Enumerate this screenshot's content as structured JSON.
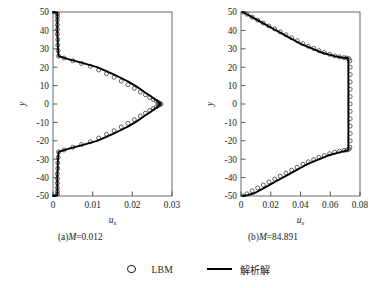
{
  "figure": {
    "background": "#ffffff",
    "ink_color": "#000000",
    "marker_color": "#3c3c3c",
    "axis_color": "#4a4a4a"
  },
  "legend": {
    "position": "bottom-center",
    "entries": [
      {
        "symbol": "open-circle",
        "label": "LBM"
      },
      {
        "symbol": "solid-line",
        "label": "解析解"
      }
    ]
  },
  "captions": {
    "a": {
      "prefix": "(a)",
      "symbol": "M",
      "value": "=0.012",
      "full": "(a)M=0.012"
    },
    "b": {
      "prefix": "(b)",
      "symbol": "M",
      "value": "=84.891",
      "full": "(b)M=84.891"
    }
  },
  "chart_data": [
    {
      "type": "line",
      "panel": "a",
      "title": "(a)M=0.012",
      "xlabel": "u_x",
      "xlabel_base": "u",
      "xlabel_sub": "x",
      "ylabel": "y",
      "xlim": [
        0,
        0.03
      ],
      "ylim": [
        -50,
        50
      ],
      "xticks": [
        0,
        0.01,
        0.02,
        0.03
      ],
      "xticklabels": [
        "0",
        "0.01",
        "0.02",
        "0.03"
      ],
      "yticks": [
        50,
        40,
        30,
        20,
        10,
        0,
        -10,
        -20,
        -30,
        -40,
        -50
      ],
      "yticklabels": [
        "50",
        "40",
        "30",
        "20",
        "10",
        "0",
        "-10",
        "-20",
        "-30",
        "-40",
        "-50"
      ],
      "grid": false,
      "series": [
        {
          "name": "解析解",
          "style": "solid-line",
          "x": [
            0.0,
            0.0011,
            0.0011,
            0.0011,
            0.0011,
            0.0011,
            0.0012,
            0.0012,
            0.0013,
            0.0014,
            0.0036,
            0.0062,
            0.0087,
            0.0111,
            0.0133,
            0.0154,
            0.0173,
            0.0191,
            0.0207,
            0.0221,
            0.0234,
            0.0245,
            0.0254,
            0.0261,
            0.0266,
            0.0269,
            0.027,
            0.0269,
            0.0266,
            0.0261,
            0.0254,
            0.0245,
            0.0234,
            0.0221,
            0.0207,
            0.0191,
            0.0173,
            0.0154,
            0.0133,
            0.0111,
            0.0087,
            0.0062,
            0.0036,
            0.0014,
            0.0013,
            0.0012,
            0.0012,
            0.0011,
            0.0011,
            0.0011,
            0.0011,
            0.0011,
            0.0
          ],
          "y": [
            50,
            49.5,
            48,
            45,
            42,
            38,
            35,
            32,
            29,
            26,
            24.5,
            23,
            21.5,
            20,
            18,
            16,
            14,
            12,
            10,
            8,
            6,
            4.5,
            3,
            2,
            1,
            0.5,
            0,
            -0.5,
            -1,
            -2,
            -3,
            -4.5,
            -6,
            -8,
            -10,
            -12,
            -14,
            -16,
            -18,
            -20,
            -21.5,
            -23,
            -24.5,
            -26,
            -29,
            -32,
            -35,
            -38,
            -42,
            -45,
            -48,
            -49.5,
            -50
          ]
        },
        {
          "name": "LBM",
          "style": "open-circle",
          "x": [
            0.0,
            0.0011,
            0.0011,
            0.0011,
            0.0011,
            0.0011,
            0.0011,
            0.0012,
            0.0012,
            0.0013,
            0.0014,
            0.0028,
            0.005,
            0.0072,
            0.0094,
            0.0115,
            0.0135,
            0.0154,
            0.0172,
            0.0189,
            0.0205,
            0.022,
            0.0233,
            0.0244,
            0.0253,
            0.0261,
            0.0266,
            0.027,
            0.0272,
            0.027,
            0.0266,
            0.0261,
            0.0253,
            0.0244,
            0.0233,
            0.022,
            0.0205,
            0.0189,
            0.0172,
            0.0154,
            0.0135,
            0.0115,
            0.0094,
            0.0072,
            0.005,
            0.0028,
            0.0014,
            0.0013,
            0.0012,
            0.0012,
            0.0011,
            0.0011,
            0.0011,
            0.0011,
            0.0011,
            0.0011,
            0.0
          ],
          "y": [
            50,
            49,
            47.5,
            45.5,
            43,
            40.5,
            38,
            35,
            32,
            29,
            26,
            25,
            23.5,
            22,
            20.5,
            18.5,
            16.5,
            14.5,
            12.5,
            10.5,
            8.5,
            6.5,
            5,
            3.5,
            2.5,
            1.5,
            0.8,
            0.2,
            0,
            -0.2,
            -0.8,
            -1.5,
            -2.5,
            -3.5,
            -5,
            -6.5,
            -8.5,
            -10.5,
            -12.5,
            -14.5,
            -16.5,
            -18.5,
            -20.5,
            -22,
            -23.5,
            -25,
            -26,
            -29,
            -32,
            -35,
            -38,
            -40.5,
            -43,
            -45.5,
            -47.5,
            -49,
            -50
          ]
        }
      ],
      "annotations": {
        "near_wall_plug_ux": 0.0011,
        "plug_region_y": [
          -25,
          25
        ],
        "peak_ux": 0.027,
        "peak_y": 0
      }
    },
    {
      "type": "line",
      "panel": "b",
      "title": "(b)M=84.891",
      "xlabel": "u_x",
      "xlabel_base": "u",
      "xlabel_sub": "x",
      "ylabel": "y",
      "xlim": [
        0,
        0.08
      ],
      "ylim": [
        -50,
        50
      ],
      "xticks": [
        0,
        0.02,
        0.04,
        0.06,
        0.08
      ],
      "xticklabels": [
        "0",
        "0.02",
        "0.04",
        "0.06",
        "0.08"
      ],
      "yticks": [
        50,
        40,
        30,
        20,
        10,
        0,
        -10,
        -20,
        -30,
        -40,
        -50
      ],
      "yticklabels": [
        "50",
        "40",
        "30",
        "20",
        "10",
        "0",
        "-10",
        "-20",
        "-30",
        "-40",
        "-50"
      ],
      "grid": false,
      "series": [
        {
          "name": "解析解",
          "style": "solid-line",
          "x": [
            0.0012,
            0.0045,
            0.009,
            0.0135,
            0.018,
            0.0225,
            0.027,
            0.0315,
            0.036,
            0.0405,
            0.045,
            0.0495,
            0.054,
            0.0585,
            0.063,
            0.0675,
            0.0715,
            0.072,
            0.0722,
            0.0722,
            0.0722,
            0.0722,
            0.0722,
            0.0722,
            0.0722,
            0.0722,
            0.0722,
            0.0722,
            0.072,
            0.0715,
            0.0675,
            0.063,
            0.0585,
            0.054,
            0.0495,
            0.045,
            0.0405,
            0.036,
            0.0315,
            0.027,
            0.0225,
            0.018,
            0.0135,
            0.009,
            0.0045,
            0.0012
          ],
          "y": [
            50,
            48.5,
            46.5,
            44.5,
            42.5,
            40.5,
            38.5,
            36.5,
            34.5,
            32.5,
            31,
            29.5,
            28,
            27,
            26,
            25.3,
            25,
            24.5,
            23,
            18,
            12,
            6,
            0,
            -6,
            -12,
            -18,
            -23,
            -24.5,
            -25,
            -25.3,
            -26,
            -27,
            -28,
            -29.5,
            -31,
            -32.5,
            -34.5,
            -36.5,
            -38.5,
            -40.5,
            -42.5,
            -44.5,
            -46.5,
            -48.5,
            -49.5,
            -50
          ]
        },
        {
          "name": "LBM",
          "style": "open-circle",
          "x": [
            0.0014,
            0.004,
            0.0075,
            0.0112,
            0.015,
            0.0188,
            0.0226,
            0.0264,
            0.0302,
            0.034,
            0.0378,
            0.0416,
            0.0452,
            0.0488,
            0.0524,
            0.056,
            0.0596,
            0.063,
            0.0662,
            0.0692,
            0.0712,
            0.0726,
            0.0732,
            0.0734,
            0.0734,
            0.0734,
            0.0734,
            0.0734,
            0.0734,
            0.0734,
            0.0734,
            0.0734,
            0.0734,
            0.0734,
            0.0732,
            0.0726,
            0.0712,
            0.0692,
            0.0662,
            0.063,
            0.0596,
            0.056,
            0.0524,
            0.0488,
            0.0452,
            0.0416,
            0.0378,
            0.034,
            0.0302,
            0.0264,
            0.0226,
            0.0188,
            0.015,
            0.0112,
            0.0075,
            0.004,
            0.0014
          ],
          "y": [
            50,
            48.8,
            47.2,
            45.6,
            44.0,
            42.4,
            40.8,
            39.2,
            37.6,
            36.0,
            34.4,
            32.8,
            31.4,
            30.2,
            29.0,
            28.0,
            27.0,
            26.2,
            25.6,
            25.2,
            25.0,
            24.6,
            23.5,
            20,
            16,
            12,
            8,
            4,
            0,
            -4,
            -8,
            -12,
            -16,
            -20,
            -23.5,
            -24.6,
            -25.0,
            -25.2,
            -25.6,
            -26.2,
            -27.0,
            -28.0,
            -29.0,
            -30.2,
            -31.4,
            -32.8,
            -34.4,
            -36.0,
            -37.6,
            -39.2,
            -40.8,
            -42.4,
            -44.0,
            -45.6,
            -47.2,
            -48.8,
            -50
          ]
        }
      ],
      "annotations": {
        "plateau_ux": 0.0722,
        "plateau_y": [
          -25,
          25
        ],
        "wall_ux": 0.0012
      }
    }
  ]
}
